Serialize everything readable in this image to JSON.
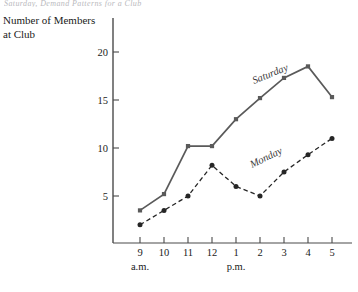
{
  "caption_strip": "Saturday, Demand Patterns for a Club",
  "chart_data": {
    "type": "line",
    "title": "",
    "ylabel": "Number of Members\nat Club",
    "xlabel": "",
    "categories": [
      "9",
      "10",
      "11",
      "12",
      "1",
      "2",
      "3",
      "4",
      "5"
    ],
    "x_period_labels": [
      {
        "text": "a.m.",
        "at_category": "9"
      },
      {
        "text": "p.m.",
        "at_category": "1"
      }
    ],
    "x_tick_labels": [
      "9",
      "10",
      "11",
      "12",
      "1",
      "2",
      "3",
      "4",
      "5"
    ],
    "y_tick_labels": [
      "5",
      "10",
      "15",
      "20"
    ],
    "y_ticks": [
      5,
      10,
      15,
      20
    ],
    "ylim": [
      0,
      21
    ],
    "grid": false,
    "legend": "inline-labels",
    "series": [
      {
        "name": "Saturday",
        "style": "solid",
        "color": "#5a5a5a",
        "marker": "square",
        "values": [
          3.5,
          5.2,
          10.2,
          10.2,
          13.0,
          15.2,
          17.3,
          18.5,
          15.3
        ]
      },
      {
        "name": "Monday",
        "style": "dashed",
        "color": "#262626",
        "marker": "circle",
        "values": [
          2.0,
          3.5,
          5.0,
          8.2,
          6.0,
          5.0,
          7.5,
          9.3,
          11.0
        ]
      }
    ],
    "annotations": [
      {
        "text": "Saturday",
        "series": "Saturday",
        "rotation": -22
      },
      {
        "text": "Monday",
        "series": "Monday",
        "rotation": -26
      }
    ]
  },
  "colors": {
    "axis": "#4a4a4a",
    "saturday": "#5a5a5a",
    "monday": "#262626",
    "text": "#1a1a1a"
  }
}
